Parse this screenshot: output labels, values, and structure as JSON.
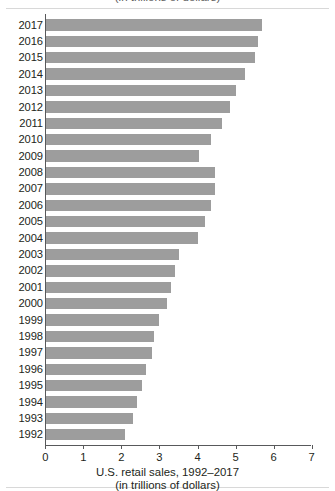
{
  "figure": {
    "top_cropped_text": "(in trillions of dollars)",
    "caption_line1": "U.S. retail sales, 1992–2017",
    "caption_line2": "(in trillions of dollars)",
    "bar_color": "#9d9d9d",
    "axis_color": "#58595b",
    "text_color": "#231f20"
  },
  "chart_data": {
    "type": "bar",
    "orientation": "horizontal",
    "title": "U.S. retail sales, 1992–2017",
    "subtitle": "(in trillions of dollars)",
    "xlabel": "U.S. retail sales, 1992–2017 (in trillions of dollars)",
    "ylabel": "",
    "xlim": [
      0,
      7
    ],
    "ylim": null,
    "grid": false,
    "legend": null,
    "xticks": [
      "0",
      "1",
      "2",
      "3",
      "4",
      "5",
      "6",
      "7"
    ],
    "xtick_values": [
      0,
      1,
      2,
      3,
      4,
      5,
      6,
      7
    ],
    "categories": [
      "2017",
      "2016",
      "2015",
      "2014",
      "2013",
      "2012",
      "2011",
      "2010",
      "2009",
      "2008",
      "2007",
      "2006",
      "2005",
      "2004",
      "2003",
      "2002",
      "2001",
      "2000",
      "1999",
      "1998",
      "1997",
      "1996",
      "1995",
      "1994",
      "1993",
      "1992"
    ],
    "values": [
      5.7,
      5.6,
      5.5,
      5.25,
      5.0,
      4.85,
      4.65,
      4.35,
      4.05,
      4.45,
      4.45,
      4.35,
      4.2,
      4.0,
      3.5,
      3.4,
      3.3,
      3.2,
      3.0,
      2.85,
      2.8,
      2.65,
      2.55,
      2.4,
      2.3,
      2.1
    ],
    "units": "trillions of dollars"
  }
}
